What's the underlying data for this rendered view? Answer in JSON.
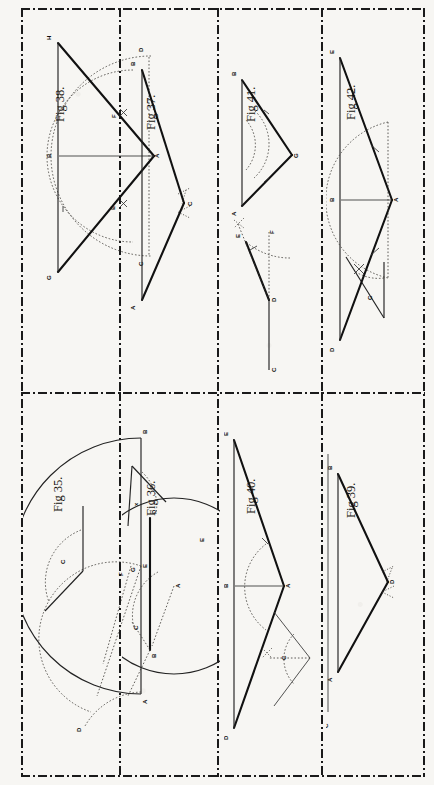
{
  "plate": {
    "label": "PLATE IX.",
    "orientation": "landscape-rotated-90",
    "page_bg": "#f7f6f3",
    "ink": "#111111",
    "border_style": "dash-dot"
  },
  "figures": [
    {
      "id": "fig35",
      "caption": "Fig 35.",
      "grid": {
        "row": 2,
        "col": 1
      },
      "description": "Semicircle on diameter AB with radius arcs; chord construction and separate given angle C.",
      "point_labels": [
        "A",
        "B",
        "D",
        "E",
        "F",
        "G",
        "C"
      ],
      "angle_label": "C"
    },
    {
      "id": "fig36",
      "caption": "Fig 36.",
      "grid": {
        "row": 2,
        "col": 2
      },
      "description": "Full circle centre A with chord BD, arcs through B and C, and separate given angle x.",
      "point_labels": [
        "A",
        "B",
        "C",
        "D",
        "E"
      ],
      "angle_label": "x"
    },
    {
      "id": "fig37",
      "caption": "Fig 37.",
      "grid": {
        "row": 1,
        "col": 2
      },
      "description": "Isosceles triangle ABC built on vertical base AB with apex C located by crossed arcs.",
      "point_labels": [
        "A",
        "B",
        "C"
      ]
    },
    {
      "id": "fig38",
      "caption": "Fig 38.",
      "grid": {
        "row": 1,
        "col": 1
      },
      "description": "Angle bisection at vertex A: arc CD cut at E and F, axis AB drawn to base GH.",
      "point_labels": [
        "A",
        "B",
        "C",
        "D",
        "E",
        "F",
        "G",
        "H"
      ]
    },
    {
      "id": "fig39",
      "caption": "Fig 39.",
      "grid": {
        "row": 2,
        "col": 4
      },
      "description": "Narrow triangle ABD with apex D set out by crossed arcs; given length line C below.",
      "point_labels": [
        "A",
        "B",
        "D",
        "C"
      ],
      "line_label": "C"
    },
    {
      "id": "fig40",
      "caption": "Fig 40.",
      "grid": {
        "row": 2,
        "col": 3
      },
      "description": "Triangle ADE with centre line AB and arc at apex; separate given angle C copied at left.",
      "point_labels": [
        "A",
        "B",
        "D",
        "E",
        "C"
      ],
      "angle_label": "C"
    },
    {
      "id": "fig41",
      "caption": "Fig 41.",
      "grid": {
        "row": 1,
        "col": 3
      },
      "description": "Angle EDF set out at D on line CD with arcs, plus triangle ABG with arcs at A and B.",
      "point_labels": [
        "C",
        "D",
        "E",
        "F",
        "A",
        "B",
        "G"
      ]
    },
    {
      "id": "fig42",
      "caption": "Fig 42.",
      "grid": {
        "row": 1,
        "col": 4
      },
      "description": "Given angle C at top; triangle ADE with centre line AB and bisecting arcs at A.",
      "point_labels": [
        "A",
        "B",
        "D",
        "E",
        "C"
      ],
      "angle_label": "C"
    }
  ]
}
